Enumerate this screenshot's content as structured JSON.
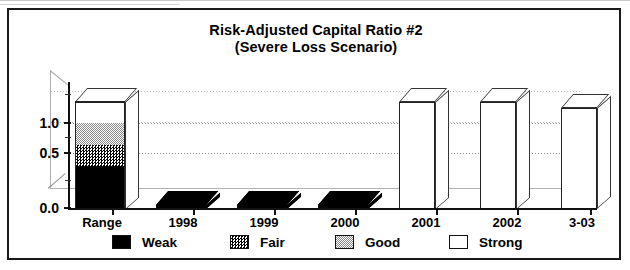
{
  "chart_data": {
    "type": "bar",
    "title": "Risk-Adjusted Capital Ratio #2",
    "subtitle": "(Severe Loss Scenario)",
    "title_lines": [
      "Risk-Adjusted Capital Ratio #2",
      "(Severe Loss Scenario)"
    ],
    "xlabel": "",
    "ylabel": "",
    "ylim": [
      0.0,
      1.25
    ],
    "yticks": [
      0.0,
      0.5,
      1.0
    ],
    "ytick_labels": [
      "0.0",
      "0.5",
      "1.0"
    ],
    "yminor_ticks": [
      0.25,
      0.75,
      1.25
    ],
    "grid": true,
    "grid_axis": "y",
    "grid_style": "dotted",
    "legend_position": "bottom",
    "three_d": true,
    "categories": [
      "Range",
      "1998",
      "1999",
      "2000",
      "2001",
      "2002",
      "3-03"
    ],
    "legend": [
      {
        "name": "Weak",
        "fill": "solid-black",
        "color": "#000000"
      },
      {
        "name": "Fair",
        "fill": "dense-dither",
        "color": "#404040"
      },
      {
        "name": "Good",
        "fill": "light-dither",
        "color": "#c8c8c8"
      },
      {
        "name": "Strong",
        "fill": "white",
        "color": "#ffffff"
      }
    ],
    "series": [
      {
        "name": "Weak",
        "values": [
          0.5,
          0.05,
          0.05,
          0.05,
          0.0,
          0.0,
          0.0
        ]
      },
      {
        "name": "Fair",
        "values": [
          0.25,
          0.0,
          0.0,
          0.0,
          0.0,
          0.0,
          0.0
        ]
      },
      {
        "name": "Good",
        "values": [
          0.25,
          0.0,
          0.0,
          0.0,
          0.0,
          0.0,
          0.0
        ]
      },
      {
        "name": "Strong",
        "values": [
          0.25,
          0.0,
          0.0,
          0.0,
          1.25,
          1.25,
          1.18
        ]
      }
    ],
    "bars": [
      {
        "category": "Range",
        "stacked": true,
        "segments": [
          {
            "label": "Weak",
            "from": 0.0,
            "to": 0.5
          },
          {
            "label": "Fair",
            "from": 0.5,
            "to": 0.75
          },
          {
            "label": "Good",
            "from": 0.75,
            "to": 1.0
          },
          {
            "label": "Strong",
            "from": 1.0,
            "to": 1.25
          }
        ],
        "total": 1.25
      },
      {
        "category": "1998",
        "stacked": false,
        "label": "Weak",
        "value": 0.05
      },
      {
        "category": "1999",
        "stacked": false,
        "label": "Weak",
        "value": 0.05
      },
      {
        "category": "2000",
        "stacked": false,
        "label": "Weak",
        "value": 0.05
      },
      {
        "category": "2001",
        "stacked": false,
        "label": "Strong",
        "value": 1.25
      },
      {
        "category": "2002",
        "stacked": false,
        "label": "Strong",
        "value": 1.25
      },
      {
        "category": "3-03",
        "stacked": false,
        "label": "Strong",
        "value": 1.18
      }
    ]
  },
  "axis": {
    "y_labels": [
      "1.0",
      "0.5",
      "0.0"
    ],
    "x_labels": [
      "Range",
      "1998",
      "1999",
      "2000",
      "2001",
      "2002",
      "3-03"
    ]
  },
  "legend_labels": [
    "Weak",
    "Fair",
    "Good",
    "Strong"
  ]
}
